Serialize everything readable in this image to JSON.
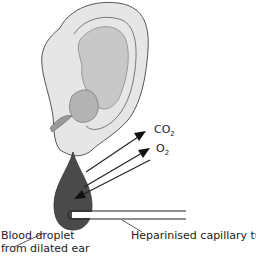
{
  "diagram": {
    "labels": {
      "co2": {
        "main": "CO",
        "sub": "2"
      },
      "o2": {
        "main": "O",
        "sub": "2"
      },
      "droplet_line1": "Blood droplet",
      "droplet_line2": "from dilated ear",
      "tube": "Heparinised capillary tube"
    },
    "colors": {
      "droplet": "#4a4a4a",
      "ear_fill": "#e6e6e6",
      "ear_inner": "#bdbdbd",
      "line": "#222222"
    }
  }
}
